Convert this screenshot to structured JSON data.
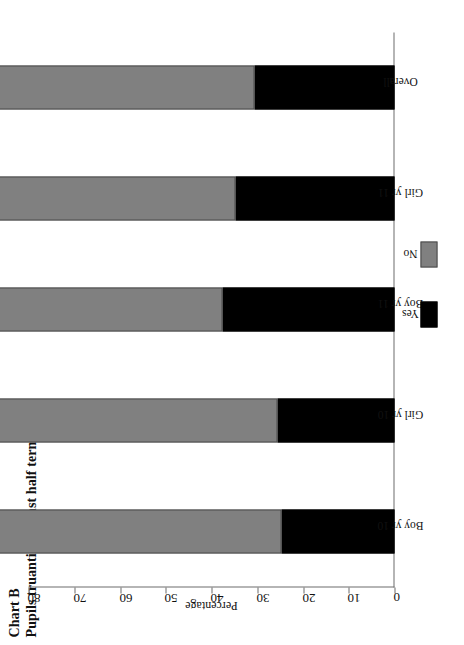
{
  "title": {
    "chart_label": "Chart B",
    "subtitle": "Pupils truanting in last half term"
  },
  "legend": {
    "items": [
      {
        "label": "Yes",
        "color": "#000000"
      },
      {
        "label": "No",
        "color": "#808080"
      }
    ]
  },
  "axis": {
    "value_title": "Percentage",
    "ticks": [
      "0",
      "10",
      "20",
      "30",
      "40",
      "50",
      "60",
      "70",
      "80"
    ]
  },
  "chart_data": {
    "type": "bar",
    "title": "Pupils truanting in last half term",
    "subtitle": "Chart B",
    "orientation": "horizontal",
    "stacked": true,
    "categories": [
      "Boy yr 10",
      "Girl yr 10",
      "Boy yr 11",
      "Girl yr 11",
      "Overall"
    ],
    "series": [
      {
        "name": "Yes",
        "color": "#000000",
        "values": [
          24.6,
          25.5,
          37.7,
          34.8,
          30.5
        ]
      },
      {
        "name": "No",
        "color": "#808080",
        "values": [
          75.4,
          74.5,
          62.3,
          65.2,
          69.5
        ]
      }
    ],
    "xlabel": "",
    "ylabel": "Percentage",
    "ylim": [
      0,
      80
    ],
    "yticks": [
      0,
      10,
      20,
      30,
      40,
      50,
      60,
      70,
      80
    ],
    "grid": false,
    "legend_position": "center-right",
    "data_labels": true
  }
}
